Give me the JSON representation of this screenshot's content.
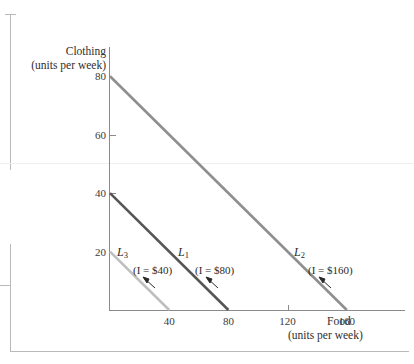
{
  "figure": {
    "y_axis_title_line1": "Clothing",
    "y_axis_title_line2": "(units per week)",
    "x_axis_title_line1": "Food",
    "x_axis_title_line2": "(units per week)"
  },
  "chart_data": {
    "type": "line",
    "title": "",
    "xlabel": "Food (units per week)",
    "ylabel": "Clothing (units per week)",
    "xlim": [
      0,
      200
    ],
    "ylim": [
      0,
      90
    ],
    "xticks": [
      40,
      80,
      120,
      160
    ],
    "yticks": [
      20,
      40,
      60,
      80
    ],
    "grid": false,
    "legend": "inline-annotations",
    "series": [
      {
        "name": "L3",
        "label": "L",
        "subscript": "3",
        "annotation": "(I = $40)",
        "income": 40,
        "color": "#bfbfbf",
        "x": [
          0,
          40
        ],
        "y": [
          20,
          0
        ]
      },
      {
        "name": "L1",
        "label": "L",
        "subscript": "1",
        "annotation": "(I = $80)",
        "income": 80,
        "color": "#565656",
        "x": [
          0,
          80
        ],
        "y": [
          40,
          0
        ]
      },
      {
        "name": "L2",
        "label": "L",
        "subscript": "2",
        "annotation": "(I = $160)",
        "income": 160,
        "color": "#8f8f8f",
        "x": [
          0,
          160
        ],
        "y": [
          80,
          0
        ]
      }
    ]
  },
  "ticks": {
    "y": [
      {
        "value": "80"
      },
      {
        "value": "60"
      },
      {
        "value": "40"
      },
      {
        "value": "20"
      }
    ],
    "x": [
      {
        "value": "40"
      },
      {
        "value": "80"
      },
      {
        "value": "120"
      },
      {
        "value": "160"
      }
    ]
  }
}
